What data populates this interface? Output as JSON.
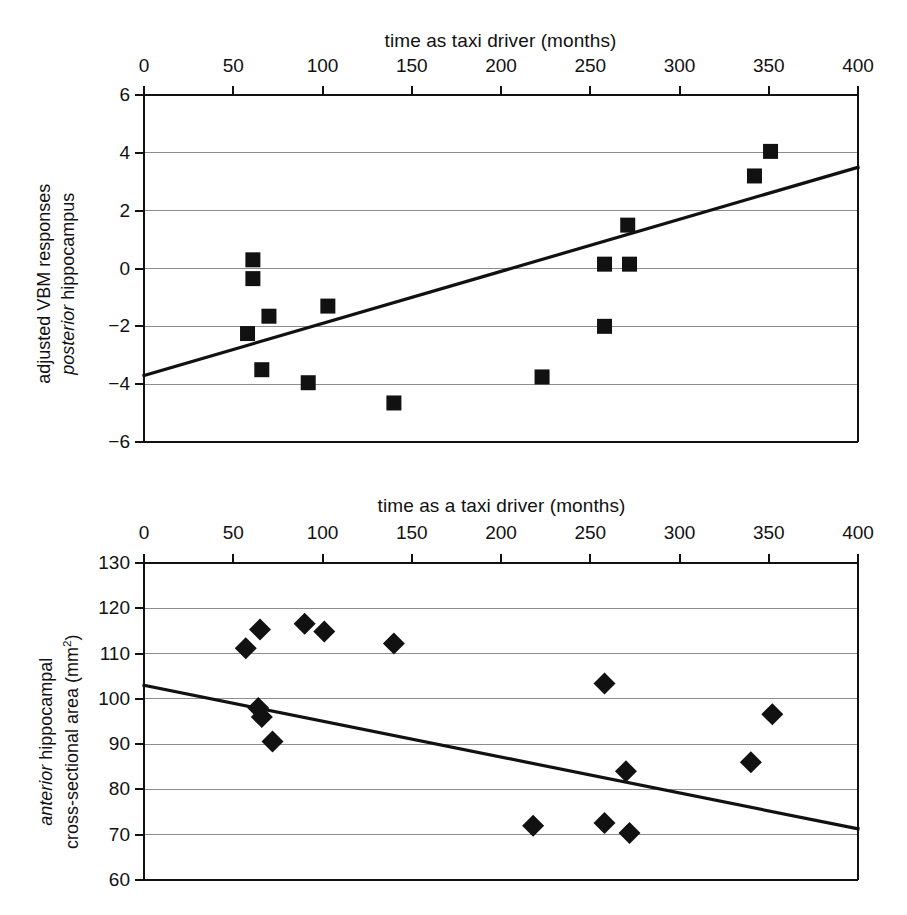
{
  "figure": {
    "background": "#ffffff",
    "ink": "#111111",
    "gridline_color": "#8d8d8d",
    "marker_color": "#111111"
  },
  "chart_data": [
    {
      "type": "scatter",
      "id": "posterior-hippocampus",
      "title": "",
      "xlabel": "time as taxi driver (months)",
      "ylabel": "adjusted VBM responses posterior hippocampus",
      "ylabel_line1": "adjusted VBM responses",
      "ylabel_line2_italic": "posterior",
      "ylabel_line2_rest": " hippocampus",
      "xlim": [
        0,
        400
      ],
      "ylim": [
        -6,
        6
      ],
      "xticks": [
        0,
        50,
        100,
        150,
        200,
        250,
        300,
        350,
        400
      ],
      "yticks": [
        6,
        4,
        2,
        0,
        -2,
        -4,
        -6
      ],
      "xtick_labels": [
        "0",
        "50",
        "100",
        "150",
        "200",
        "250",
        "300",
        "350",
        "400"
      ],
      "ytick_labels": [
        "6",
        "4",
        "2",
        "0",
        "−2",
        "−4",
        "−6"
      ],
      "xaxis_position": "top",
      "grid": "horizontal",
      "legend": "none",
      "marker": "square",
      "points": [
        {
          "x": 58,
          "y": -2.25
        },
        {
          "x": 61,
          "y": 0.3
        },
        {
          "x": 61,
          "y": -0.35
        },
        {
          "x": 66,
          "y": -3.5
        },
        {
          "x": 70,
          "y": -1.65
        },
        {
          "x": 92,
          "y": -3.95
        },
        {
          "x": 103,
          "y": -1.3
        },
        {
          "x": 140,
          "y": -4.65
        },
        {
          "x": 223,
          "y": -3.75
        },
        {
          "x": 258,
          "y": 0.15
        },
        {
          "x": 258,
          "y": -2.0
        },
        {
          "x": 271,
          "y": 1.5
        },
        {
          "x": 272,
          "y": 0.15
        },
        {
          "x": 342,
          "y": 3.2
        },
        {
          "x": 351,
          "y": 4.05
        }
      ],
      "trendline": {
        "x0": 0,
        "y0": -3.7,
        "x1": 400,
        "y1": 3.5
      }
    },
    {
      "type": "scatter",
      "id": "anterior-hippocampus",
      "title": "",
      "xlabel": "time as a taxi driver (months)",
      "ylabel": "anterior hippocampal cross-sectional area (mm2)",
      "ylabel_line1_italic": "anterior",
      "ylabel_line1_rest": " hippocampal",
      "ylabel_line2": "cross-sectional area (mm",
      "ylabel_line2_sup": "2",
      "ylabel_line2_end": ")",
      "xlim": [
        0,
        400
      ],
      "ylim": [
        60,
        130
      ],
      "xticks": [
        0,
        50,
        100,
        150,
        200,
        250,
        300,
        350,
        400
      ],
      "yticks": [
        130,
        120,
        110,
        100,
        90,
        80,
        70,
        60
      ],
      "xtick_labels": [
        "0",
        "50",
        "100",
        "150",
        "200",
        "250",
        "300",
        "350",
        "400"
      ],
      "ytick_labels": [
        "130",
        "120",
        "110",
        "100",
        "90",
        "80",
        "70",
        "60"
      ],
      "xaxis_position": "top",
      "grid": "horizontal",
      "legend": "none",
      "marker": "diamond",
      "points": [
        {
          "x": 57,
          "y": 111.2
        },
        {
          "x": 64,
          "y": 98.0
        },
        {
          "x": 65,
          "y": 115.3
        },
        {
          "x": 66,
          "y": 96.0
        },
        {
          "x": 72,
          "y": 90.6
        },
        {
          "x": 90,
          "y": 116.6
        },
        {
          "x": 101,
          "y": 114.9
        },
        {
          "x": 140,
          "y": 112.2
        },
        {
          "x": 218,
          "y": 72.0
        },
        {
          "x": 258,
          "y": 103.4
        },
        {
          "x": 258,
          "y": 72.6
        },
        {
          "x": 270,
          "y": 84.0
        },
        {
          "x": 272,
          "y": 70.4
        },
        {
          "x": 340,
          "y": 86.0
        },
        {
          "x": 352,
          "y": 96.6
        }
      ],
      "trendline": {
        "x0": 0,
        "y0": 103.0,
        "x1": 400,
        "y1": 71.3
      }
    }
  ]
}
